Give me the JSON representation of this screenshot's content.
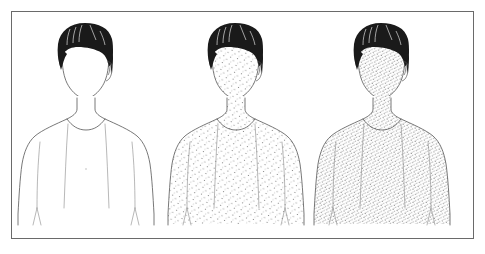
{
  "illustration": {
    "title": "Rash Progression Illustration",
    "subject": "male-head-and-torso",
    "view": "frontal",
    "panel_count": 3,
    "border_color": "#6a6a6a",
    "background_color": "#ffffff",
    "outline_color": "#555555",
    "hair_color": "#1a1a1a",
    "hair_highlight_color": "#ffffff",
    "rash_dot_color": "#777777"
  },
  "panels": [
    {
      "id": "panel-clear",
      "label": "Stage 1 - clear skin",
      "stage_number": "1",
      "rash_present": "no",
      "rash_density": "none",
      "dot_count": 0,
      "dot_spacing_px": 0,
      "hair": "dark bowl cut",
      "skin_fill": "#ffffff"
    },
    {
      "id": "panel-sparse",
      "label": "Stage 2 - sparse rash",
      "stage_number": "2",
      "rash_present": "yes",
      "rash_density": "sparse",
      "dot_count": 430,
      "dot_spacing_px": 7,
      "hair": "dark bowl cut",
      "skin_fill": "#ffffff"
    },
    {
      "id": "panel-dense",
      "label": "Stage 3 - dense rash",
      "stage_number": "3",
      "rash_present": "yes",
      "rash_density": "dense",
      "dot_count": 980,
      "dot_spacing_px": 4,
      "hair": "dark bowl cut",
      "skin_fill": "#ffffff"
    }
  ],
  "anatomy": {
    "regions": [
      "face",
      "neck",
      "shoulders",
      "chest",
      "upper-arms",
      "torso"
    ],
    "head_outline": "oval jaw tapering to chin",
    "body_outline": "shoulders, arms at sides, torso cropped at waist"
  }
}
